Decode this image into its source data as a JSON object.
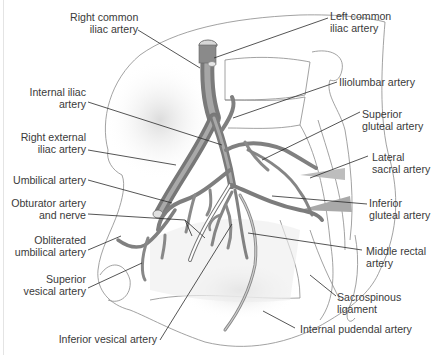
{
  "figure": {
    "type": "anatomical-illustration",
    "colors": {
      "artery_fill": "#8c8c8c",
      "artery_dark": "#5e5e5e",
      "artery_light": "#c4c4c4",
      "outline": "#7a7a7a",
      "leader": "#2a2a2a",
      "label_text": "#3a3a3a",
      "background": "#ffffff"
    }
  },
  "labels": {
    "right_common_iliac": {
      "line1": "Right common",
      "line2": "iliac artery"
    },
    "left_common_iliac": {
      "line1": "Left common",
      "line2": "iliac artery"
    },
    "internal_iliac": {
      "line1": "Internal iliac",
      "line2": "artery"
    },
    "iliolumbar": {
      "line1": "Iliolumbar artery"
    },
    "right_external_iliac": {
      "line1": "Right external",
      "line2": "iliac artery"
    },
    "superior_gluteal": {
      "line1": "Superior",
      "line2": "gluteal artery"
    },
    "lateral_sacral": {
      "line1": "Lateral",
      "line2": "sacral artery"
    },
    "umbilical": {
      "line1": "Umbilical artery"
    },
    "obturator": {
      "line1": "Obturator artery",
      "line2": "and nerve"
    },
    "inferior_gluteal": {
      "line1": "Inferior",
      "line2": "gluteal artery"
    },
    "obliterated_umbilical": {
      "line1": "Obliterated",
      "line2": "umbilical artery"
    },
    "middle_rectal": {
      "line1": "Middle rectal",
      "line2": "artery"
    },
    "superior_vesical": {
      "line1": "Superior",
      "line2": "vesical artery"
    },
    "sacrospinous": {
      "line1": "Sacrospinous",
      "line2": "ligament"
    },
    "inferior_vesical": {
      "line1": "Inferior vesical artery"
    },
    "internal_pudendal": {
      "line1": "Internal pudendal artery"
    }
  }
}
